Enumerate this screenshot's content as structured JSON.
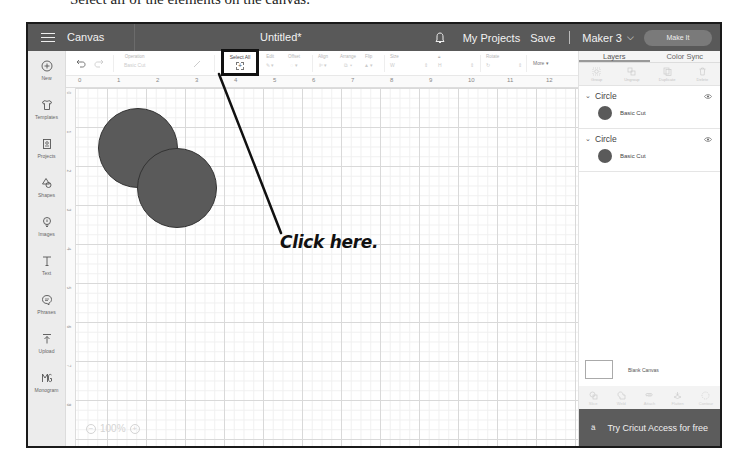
{
  "caption": {
    "partial_text": "Select all of the elements on the canvas."
  },
  "header": {
    "menu_icon": "hamburger-icon",
    "section": "Canvas",
    "title": "Untitled*",
    "notification_icon": "bell-icon",
    "my_projects": "My Projects",
    "save": "Save",
    "machine": "Maker 3",
    "machine_chevron": "⌵",
    "make_it": "Make It"
  },
  "sidebar": {
    "items": [
      {
        "label": "New",
        "icon": "plus-circle-icon"
      },
      {
        "label": "Templates",
        "icon": "shirt-icon"
      },
      {
        "label": "Projects",
        "icon": "projects-icon"
      },
      {
        "label": "Shapes",
        "icon": "shapes-icon"
      },
      {
        "label": "Images",
        "icon": "lightbulb-icon"
      },
      {
        "label": "Text",
        "icon": "text-icon"
      },
      {
        "label": "Phrases",
        "icon": "speech-bubble-icon"
      },
      {
        "label": "Upload",
        "icon": "upload-icon"
      },
      {
        "label": "Monogram",
        "icon": "monogram-icon"
      }
    ]
  },
  "toolbar": {
    "undo_icon": "undo-icon",
    "redo_icon": "redo-icon",
    "operation_label": "Operation",
    "operation_value": "Basic Cut",
    "select_all_label": "Select All",
    "edit_label": "Edit",
    "offset_label": "Offset",
    "align_label": "Align",
    "arrange_label": "Arrange",
    "flip_label": "Flip",
    "size_label": "Size",
    "size_w": "W",
    "size_h": "H",
    "rotate_label": "Rotate",
    "more_label": "More ▾"
  },
  "ruler": {
    "horizontal": [
      "0",
      "1",
      "2",
      "3",
      "4",
      "5",
      "6",
      "7",
      "8",
      "9",
      "10",
      "11",
      "12"
    ],
    "vertical": [
      "0",
      "1",
      "2",
      "3",
      "4",
      "5",
      "6",
      "7",
      "8"
    ]
  },
  "canvas": {
    "zoom_level": "100%",
    "zoom_out": "−",
    "zoom_in": "+",
    "shapes": [
      {
        "type": "circle",
        "fill": "#5a5a5a"
      },
      {
        "type": "circle",
        "fill": "#5a5a5a"
      }
    ]
  },
  "callout": {
    "text": "Click here."
  },
  "right_panel": {
    "tabs": [
      {
        "label": "Layers",
        "active": true
      },
      {
        "label": "Color Sync",
        "active": false
      }
    ],
    "top_actions": [
      "Group",
      "Ungroup",
      "Duplicate",
      "Delete"
    ],
    "layers": [
      {
        "name": "Circle",
        "operation": "Basic Cut",
        "color": "#5a5a5a"
      },
      {
        "name": "Circle",
        "operation": "Basic Cut",
        "color": "#5a5a5a"
      }
    ],
    "blank_canvas": "Blank Canvas",
    "bottom_actions": [
      "Slice",
      "Weld",
      "Attach",
      "Flatten",
      "Contour"
    ],
    "promo": "Try Cricut Access for free"
  },
  "colors": {
    "header_bg": "#595959",
    "shape_fill": "#5a5a5a",
    "promo_bg": "#5c5c5c",
    "highlight_border": "#111111"
  }
}
